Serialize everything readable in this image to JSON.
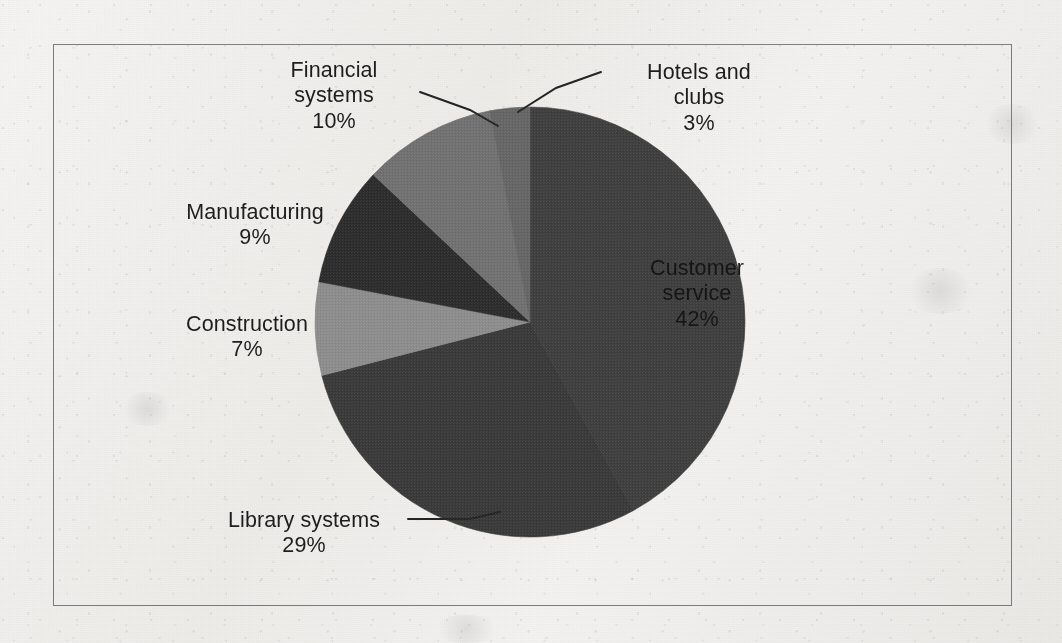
{
  "figure": {
    "background_color": "#f1f0ee",
    "frame_color": "#7c7c7c",
    "label_color": "#1d1d1d"
  },
  "chart_data": {
    "type": "pie",
    "title": "",
    "subtitle": "",
    "xlabel": "",
    "ylabel": "",
    "grid": false,
    "legend_position": "none",
    "label_style": "category name and percentage",
    "start_angle_deg": 0,
    "direction": "clockwise",
    "total_percent": 100,
    "categories": [
      "Customer service",
      "Library systems",
      "Construction",
      "Manufacturing",
      "Financial systems",
      "Hotels and clubs"
    ],
    "values": [
      42,
      29,
      7,
      9,
      10,
      3
    ],
    "unit": "%",
    "slices": [
      {
        "label": "Customer service",
        "value": 42,
        "value_text": "42%",
        "color": "#3f3f3f",
        "label_placement": "inside",
        "leader_line": false
      },
      {
        "label": "Library systems",
        "value": 29,
        "value_text": "29%",
        "color": "#3a3a3a",
        "label_placement": "outside-bottom-left",
        "leader_line": true
      },
      {
        "label": "Construction",
        "value": 7,
        "value_text": "7%",
        "color": "#8d8d8d",
        "label_placement": "outside-left",
        "leader_line": false
      },
      {
        "label": "Manufacturing",
        "value": 9,
        "value_text": "9%",
        "color": "#2d2d2d",
        "label_placement": "outside-left",
        "leader_line": false
      },
      {
        "label": "Financial systems",
        "value": 10,
        "value_text": "10%",
        "color": "#717171",
        "label_placement": "outside-top-left",
        "leader_line": true
      },
      {
        "label": "Hotels and clubs",
        "value": 3,
        "value_text": "3%",
        "color": "#666666",
        "label_placement": "outside-top-right",
        "leader_line": true
      }
    ]
  },
  "labels": {
    "financial": {
      "line1": "Financial",
      "line2": "systems",
      "percent": "10%"
    },
    "hotels": {
      "line1": "Hotels and",
      "line2": "clubs",
      "percent": "3%"
    },
    "manufacturing": {
      "line1": "Manufacturing",
      "percent": "9%"
    },
    "construction": {
      "line1": "Construction",
      "percent": "7%"
    },
    "library": {
      "line1": "Library systems",
      "percent": "29%"
    },
    "customer": {
      "line1": "Customer",
      "line2": "service",
      "percent": "42%"
    }
  }
}
